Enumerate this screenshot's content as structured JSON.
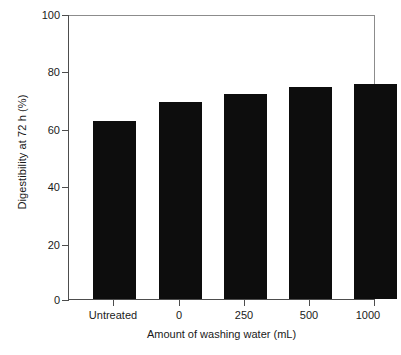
{
  "chart_data": {
    "type": "bar",
    "title": "",
    "xlabel": "Amount of washing water (mL)",
    "ylabel": "Digestibility at 72 h (%)",
    "categories": [
      "Untreated",
      "0",
      "250",
      "500",
      "1000"
    ],
    "values": [
      63,
      69.5,
      72.5,
      75,
      76
    ],
    "series": [
      {
        "name": "Digestibility at 72 h",
        "values": [
          63,
          69.5,
          72.5,
          75,
          76
        ]
      }
    ],
    "ylim": [
      0,
      100
    ],
    "yticks": [
      0,
      20,
      40,
      60,
      80,
      100
    ],
    "ytick_labels": [
      "0",
      "20",
      "40",
      "60",
      "80",
      "100"
    ],
    "grid": false,
    "legend": false,
    "legend_position": "none",
    "bar_color": "#0d0d0d",
    "axis_color": "#4d4d4d",
    "frame_color": "#8c8c8c",
    "background": "#ffffff"
  }
}
